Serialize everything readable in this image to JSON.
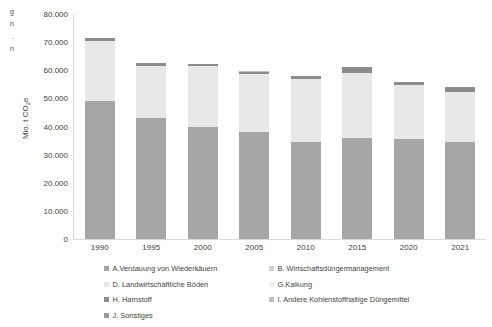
{
  "edge_caption": {
    "lines": [
      "g",
      "n",
      ".",
      "n"
    ]
  },
  "axis": {
    "y_title": "Mio. t CO",
    "y_title_sub": "2",
    "y_title_suffix": "e",
    "y_ticks": [
      "80.000",
      "70.000",
      "60.000",
      "50.000",
      "40.000",
      "30.000",
      "20.000",
      "10.000",
      "0"
    ],
    "x_ticks": [
      "1990",
      "1995",
      "2000",
      "2005",
      "2010",
      "2015",
      "2020",
      "2021"
    ]
  },
  "legend": {
    "items": [
      {
        "label": "A.Verdauung von Wiederkäuern",
        "color": "#a6a6a6"
      },
      {
        "label": "B. Wirtschaftsdüngermanagement",
        "color": "#d0d0d0"
      },
      {
        "label": "D. Landwirtschaftliche Böden",
        "color": "#e8e8e8"
      },
      {
        "label": "G.Kalkung",
        "color": "#efefef"
      },
      {
        "label": "H. Harnstoff",
        "color": "#8c8c8c"
      },
      {
        "label": "I. Andere Kohlenstoffhaltige Düngemittel",
        "color": "#bfbfbf"
      },
      {
        "label": "J. Sonstiges",
        "color": "#9a9a9a"
      }
    ]
  },
  "chart_data": {
    "type": "bar",
    "stacked": true,
    "title": "",
    "xlabel": "",
    "ylabel": "Mio. t CO2e",
    "ylim": [
      0,
      80000
    ],
    "ytick_step": 10000,
    "grid": false,
    "legend_position": "bottom",
    "categories": [
      "1990",
      "1995",
      "2000",
      "2005",
      "2010",
      "2015",
      "2020",
      "2021"
    ],
    "series": [
      {
        "name": "A.Verdauung von Wiederkäuern",
        "color": "#a6a6a6",
        "values": [
          49000,
          43200,
          40000,
          38200,
          34600,
          36000,
          35400,
          34600
        ]
      },
      {
        "name": "B. Wirtschaftsdüngermanagement",
        "color": "#d0d0d0",
        "values": [
          0,
          0,
          0,
          0,
          0,
          0,
          0,
          0
        ]
      },
      {
        "name": "D. Landwirtschaftliche Böden",
        "color": "#e8e8e8",
        "values": [
          21400,
          18300,
          21500,
          20400,
          22200,
          23200,
          19400,
          17800
        ]
      },
      {
        "name": "G.Kalkung",
        "color": "#efefef",
        "values": [
          0,
          0,
          0,
          0,
          0,
          0,
          0,
          0
        ]
      },
      {
        "name": "H. Harnstoff",
        "color": "#8c8c8c",
        "values": [
          1100,
          1200,
          700,
          900,
          1000,
          1800,
          1200,
          1600
        ]
      },
      {
        "name": "I. Andere Kohlenstoffhaltige Düngemittel",
        "color": "#bfbfbf",
        "values": [
          0,
          0,
          0,
          400,
          200,
          0,
          0,
          0
        ]
      },
      {
        "name": "J. Sonstiges",
        "color": "#9a9a9a",
        "values": [
          0,
          0,
          0,
          0,
          0,
          0,
          0,
          0
        ]
      }
    ],
    "totals": [
      71500,
      62700,
      62200,
      59900,
      58000,
      61000,
      56000,
      54000
    ]
  }
}
